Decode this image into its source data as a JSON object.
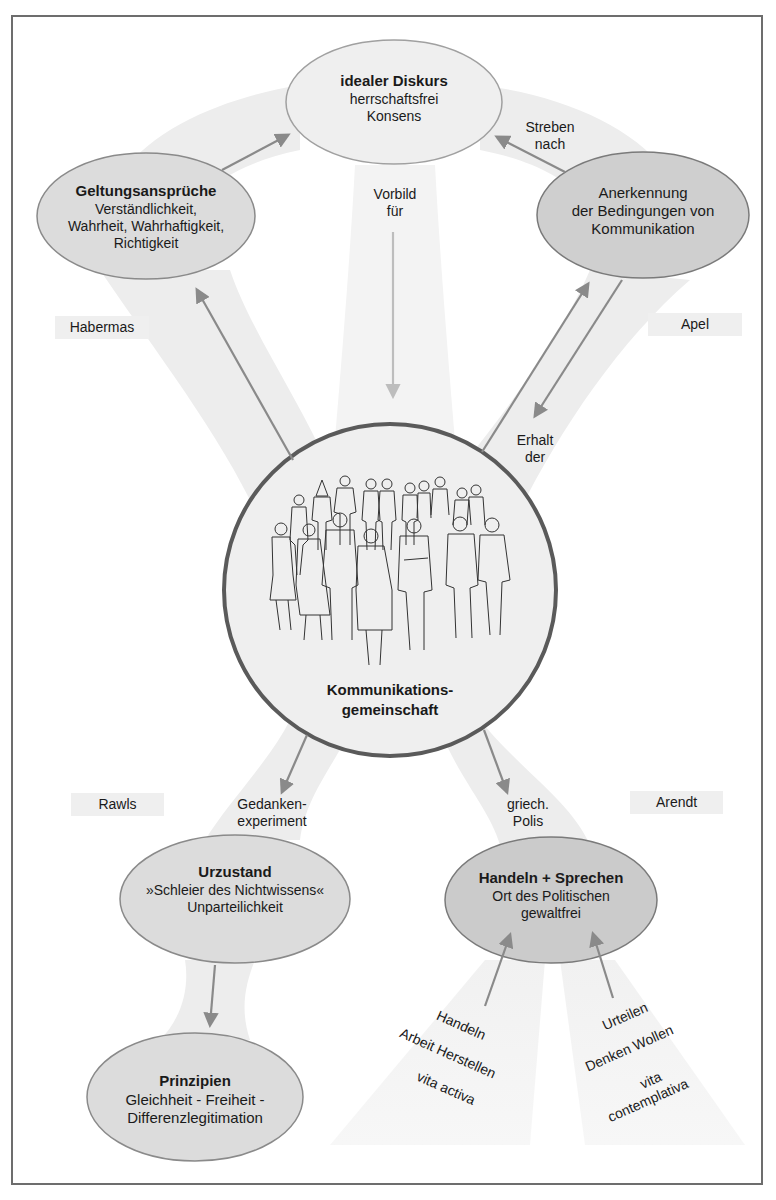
{
  "diagram": {
    "center": {
      "title_line1": "Kommunikations-",
      "title_line2": "gemeinschaft",
      "illustration": "group-of-people-illustration"
    },
    "nodes": {
      "idealer_diskurs": {
        "title": "idealer Diskurs",
        "lines": [
          "herrschaftsfrei",
          "Konsens"
        ],
        "fill": "#efefef"
      },
      "geltungsansprueche": {
        "title": "Geltungsansprüche",
        "lines": [
          "Verständlichkeit,",
          "Wahrheit, Wahrhaftigkeit,",
          "Richtigkeit"
        ],
        "fill": "#dcdcdc"
      },
      "anerkennung": {
        "title": "",
        "lines": [
          "Anerkennung",
          "der Bedingungen von",
          "Kommunikation"
        ],
        "fill": "#cfcfcf"
      },
      "urzustand": {
        "title": "Urzustand",
        "lines": [
          "»Schleier des Nichtwissens«",
          "Unparteilichkeit"
        ],
        "fill": "#dcdcdc"
      },
      "handeln_sprechen": {
        "title": "Handeln + Sprechen",
        "lines": [
          "Ort des Politischen",
          "gewaltfrei"
        ],
        "fill": "#cbcbcb"
      },
      "prinzipien": {
        "title": "Prinzipien",
        "lines": [
          "Gleichheit - Freiheit -",
          "Differenzlegitimation"
        ],
        "fill": "#dcdcdc"
      }
    },
    "edge_labels": {
      "vorbild": [
        "Vorbild",
        "für"
      ],
      "streben": [
        "Streben",
        "nach"
      ],
      "erhalt": [
        "Erhalt",
        "der"
      ],
      "gedanken": [
        "Gedanken-",
        "experiment"
      ],
      "polis": [
        "griech.",
        "Polis"
      ]
    },
    "authors": {
      "habermas": "Habermas",
      "apel": "Apel",
      "rawls": "Rawls",
      "arendt": "Arendt"
    },
    "vita_activa": {
      "handeln": "Handeln",
      "arbeit_herstellen": "Arbeit  Herstellen",
      "label": "vita activa"
    },
    "vita_contemplativa": {
      "urteilen": "Urteilen",
      "denken_wollen": "Denken  Wollen",
      "label_line1": "vita",
      "label_line2": "contemplativa"
    },
    "colors": {
      "band": "#ededed",
      "arrow": "#8a8a8a",
      "arrow_light": "#bdbdbd",
      "node_border": "#8a8a8a",
      "center_border": "#5a5a5a",
      "frame": "#6d6d6d"
    }
  }
}
